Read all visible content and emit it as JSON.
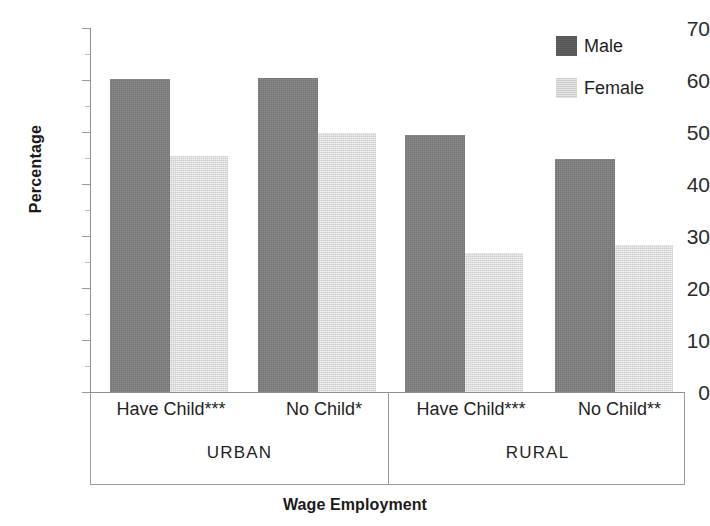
{
  "chart_data": {
    "type": "bar",
    "title": "",
    "xlabel": "Wage Employment",
    "ylabel": "Percentage",
    "ylim": [
      0,
      70
    ],
    "ytick_step": 10,
    "yticks": [
      0,
      10,
      20,
      30,
      40,
      50,
      60,
      70
    ],
    "grid": false,
    "legend_position": "top-right",
    "categories": [
      "Have Child***",
      "No Child*",
      "Have Child***",
      "No Child**"
    ],
    "groups": [
      {
        "name": "URBAN",
        "categories": [
          "Have Child***",
          "No Child*"
        ]
      },
      {
        "name": "RURAL",
        "categories": [
          "Have Child***",
          "No Child**"
        ]
      }
    ],
    "series": [
      {
        "name": "Male",
        "color": "#7f7f7f",
        "values": [
          60.2,
          60.4,
          49.5,
          44.8
        ]
      },
      {
        "name": "Female",
        "color": "#dcdcdc",
        "values": [
          45.4,
          49.9,
          26.7,
          28.3
        ]
      }
    ]
  },
  "legend": {
    "items": [
      {
        "label": "Male",
        "color": "#595959"
      },
      {
        "label": "Female",
        "color": "#d4d4d4"
      }
    ]
  },
  "axes": {
    "y_title": "Percentage",
    "x_title": "Wage Employment",
    "y_tick_labels": [
      "70",
      "60",
      "50",
      "40",
      "30",
      "20",
      "10",
      "0"
    ]
  },
  "category_labels": [
    "Have Child***",
    "No Child*",
    "Have Child***",
    "No Child**"
  ],
  "group_labels": [
    "URBAN",
    "RURAL"
  ]
}
